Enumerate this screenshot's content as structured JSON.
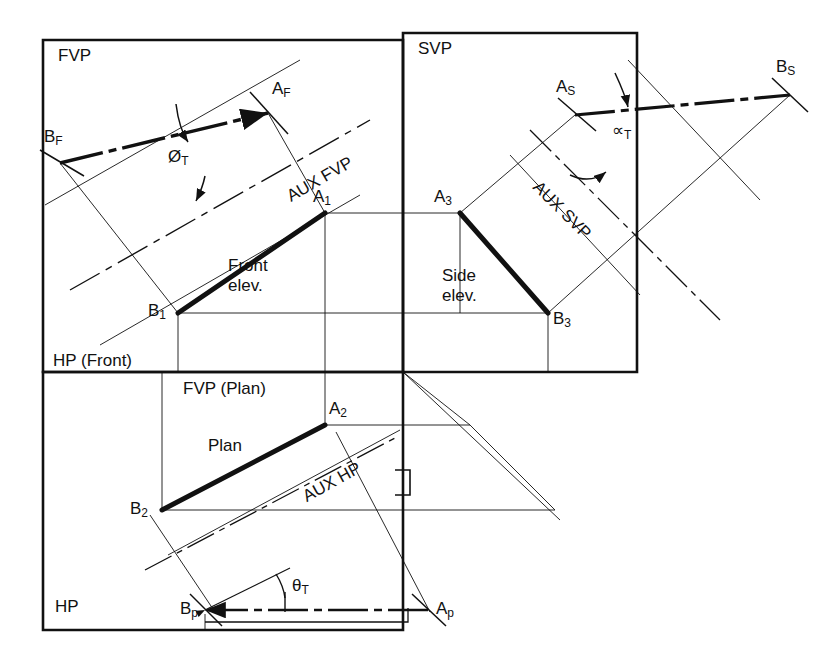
{
  "drawing": {
    "title_hidden": "",
    "type": "orthographic-projection-true-angles",
    "stroke_color": "#111111",
    "background": "#ffffff"
  },
  "quadrant_labels": {
    "fvp": "FVP",
    "svp": "SVP",
    "hp_front": "HP (Front)",
    "fvp_plan": "FVP (Plan)",
    "hp": "HP"
  },
  "view_labels": {
    "front_elev_line1": "Front",
    "front_elev_line2": "elev.",
    "side_elev_line1": "Side",
    "side_elev_line2": "elev.",
    "plan": "Plan"
  },
  "aux_labels": {
    "aux_fvp": "AUX FVP",
    "aux_svp": "AUX SVP",
    "aux_hp": "AUX HP"
  },
  "angle_labels": {
    "phi_t": "Ø",
    "phi_t_sub": "T",
    "alpha_t": "∝",
    "alpha_t_sub": "T",
    "theta_t": "θ",
    "theta_t_sub": "T"
  },
  "points": {
    "B_F": {
      "base": "B",
      "sub": "F",
      "x": 60,
      "y": 163
    },
    "A_F": {
      "base": "A",
      "sub": "F",
      "x": 268,
      "y": 113
    },
    "A_1": {
      "base": "A",
      "sub": "1",
      "x": 325,
      "y": 213
    },
    "B_1": {
      "base": "B",
      "sub": "1",
      "x": 178,
      "y": 313
    },
    "A_3": {
      "base": "A",
      "sub": "3",
      "x": 460,
      "y": 213
    },
    "B_3": {
      "base": "B",
      "sub": "3",
      "x": 548,
      "y": 313
    },
    "A_S": {
      "base": "A",
      "sub": "S",
      "x": 575,
      "y": 115
    },
    "B_S": {
      "base": "B",
      "sub": "S",
      "x": 790,
      "y": 95
    },
    "A_2": {
      "base": "A",
      "sub": "2",
      "x": 325,
      "y": 425
    },
    "B_2": {
      "base": "B",
      "sub": "2",
      "x": 162,
      "y": 510
    },
    "B_p": {
      "base": "B",
      "sub": "p",
      "x": 205,
      "y": 610
    },
    "A_p": {
      "base": "A",
      "sub": "p",
      "x": 428,
      "y": 610
    }
  },
  "frames": {
    "fvp_box": {
      "x": 43,
      "y": 40,
      "w": 360,
      "h": 332
    },
    "svp_box": {
      "x": 403,
      "y": 33,
      "w": 234,
      "h": 339
    },
    "hp_box": {
      "x": 43,
      "y": 372,
      "w": 360,
      "h": 258
    }
  }
}
